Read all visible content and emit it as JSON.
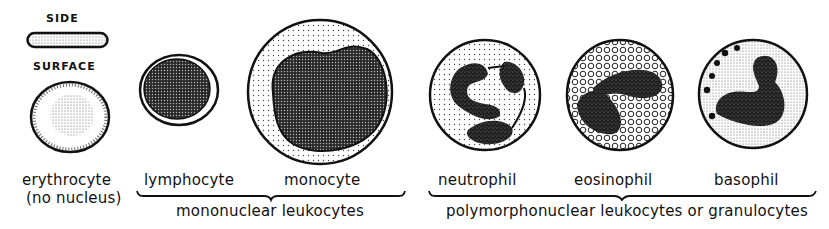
{
  "figure": {
    "erythrocyte": {
      "side_caption": "SIDE",
      "surface_caption": "SURFACE",
      "label": "erythrocyte",
      "note": "(no nucleus)"
    },
    "mononuclear": {
      "cells": [
        {
          "name": "lymphocyte"
        },
        {
          "name": "monocyte"
        }
      ],
      "group_label": "mononuclear leukocytes"
    },
    "polymorphonuclear": {
      "cells": [
        {
          "name": "neutrophil"
        },
        {
          "name": "eosinophil"
        },
        {
          "name": "basophil"
        }
      ],
      "group_label": "polymorphonuclear leukocytes or granulocytes"
    }
  },
  "colors": {
    "ink": "#111111",
    "background": "#ffffff",
    "stipple": "#555555"
  }
}
